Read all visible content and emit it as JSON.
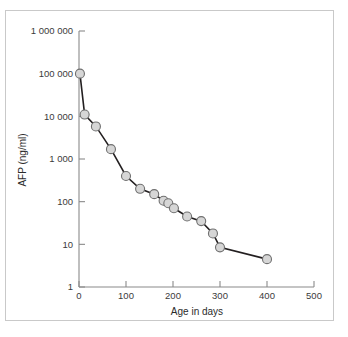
{
  "figure": {
    "background_color": "#ffffff",
    "frame_color": "#c9c9c9"
  },
  "chart_data": {
    "type": "line",
    "title": "",
    "subtitle": "",
    "xlabel": "Age in days",
    "ylabel": "AFP (ng/ml)",
    "xlim": [
      0,
      500
    ],
    "ylim": [
      1,
      1000000
    ],
    "yscale": "log",
    "xscale": "linear",
    "grid": false,
    "legend": null,
    "marker_style": {
      "shape": "circle",
      "fill_color": "#d6d6d6",
      "edge_color": "#6f6f6f",
      "size_px": 9
    },
    "line_style": {
      "color": "#231f20",
      "width_px": 1.6
    },
    "xticks": [
      0,
      100,
      200,
      300,
      400,
      500
    ],
    "xtick_labels": [
      "0",
      "100",
      "200",
      "300",
      "400",
      "500"
    ],
    "yticks": [
      1,
      10,
      100,
      1000,
      10000,
      100000,
      1000000
    ],
    "ytick_labels": [
      "1",
      "10",
      "100",
      "1 000",
      "10 000",
      "100 000",
      "1 000 000"
    ],
    "x": [
      2,
      12,
      36,
      68,
      100,
      130,
      160,
      180,
      190,
      202,
      230,
      260,
      285,
      300,
      400
    ],
    "y": [
      100000,
      11000,
      5800,
      1700,
      400,
      200,
      150,
      105,
      92,
      70,
      45,
      35,
      18,
      8.5,
      4.5
    ],
    "points": [
      {
        "x": 2,
        "y": 100000
      },
      {
        "x": 12,
        "y": 11000
      },
      {
        "x": 36,
        "y": 5800
      },
      {
        "x": 68,
        "y": 1700
      },
      {
        "x": 100,
        "y": 400
      },
      {
        "x": 130,
        "y": 200
      },
      {
        "x": 160,
        "y": 150
      },
      {
        "x": 180,
        "y": 105
      },
      {
        "x": 190,
        "y": 92
      },
      {
        "x": 202,
        "y": 70
      },
      {
        "x": 230,
        "y": 45
      },
      {
        "x": 260,
        "y": 35
      },
      {
        "x": 285,
        "y": 18
      },
      {
        "x": 300,
        "y": 8.5
      },
      {
        "x": 400,
        "y": 4.5
      }
    ]
  }
}
